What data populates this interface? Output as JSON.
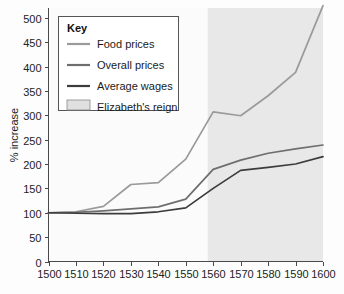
{
  "chart_data": {
    "type": "line",
    "title": "",
    "xlabel": "",
    "ylabel": "% increase",
    "xlim": [
      1500,
      1600
    ],
    "ylim": [
      0,
      520
    ],
    "grid": false,
    "legend_position": "top-left",
    "x": [
      1500,
      1510,
      1520,
      1530,
      1540,
      1550,
      1560,
      1570,
      1580,
      1590,
      1600
    ],
    "xticks": [
      "1500",
      "1510",
      "1520",
      "1530",
      "1540",
      "1550",
      "1560",
      "1570",
      "1580",
      "1590",
      "1600"
    ],
    "yticks": [
      "0",
      "50",
      "100",
      "150",
      "200",
      "250",
      "300",
      "350",
      "400",
      "450",
      "500"
    ],
    "ytick_values": [
      0,
      50,
      100,
      150,
      200,
      250,
      300,
      350,
      400,
      450,
      500
    ],
    "series": [
      {
        "name": "Food prices",
        "color": "#9a9a9a",
        "values": [
          100,
          102,
          113,
          158,
          162,
          210,
          307,
          299,
          340,
          388,
          525
        ]
      },
      {
        "name": "Overall prices",
        "color": "#6e6e6e",
        "values": [
          100,
          101,
          104,
          108,
          112,
          128,
          189,
          208,
          222,
          231,
          239
        ]
      },
      {
        "name": "Average wages",
        "color": "#3c3c3c",
        "values": [
          100,
          99,
          98,
          98,
          102,
          110,
          150,
          187,
          193,
          200,
          215
        ]
      }
    ],
    "shaded_region": {
      "label": "Elizabeth's reign",
      "x_start": 1558,
      "x_end": 1600,
      "color": "#e8e8e8"
    }
  },
  "legend": {
    "title": "Key",
    "items": [
      {
        "label": "Food prices",
        "type": "line",
        "color": "#9a9a9a"
      },
      {
        "label": "Overall prices",
        "type": "line",
        "color": "#6e6e6e"
      },
      {
        "label": "Average wages",
        "type": "line",
        "color": "#3c3c3c"
      },
      {
        "label": "Elizabeth's reign",
        "type": "swatch",
        "color": "#e0e0e0"
      }
    ]
  }
}
